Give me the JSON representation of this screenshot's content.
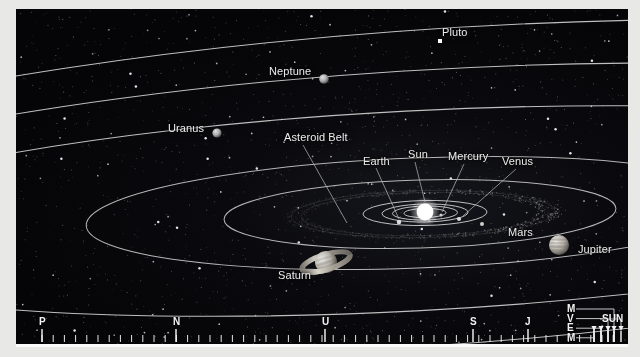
{
  "diagram": {
    "background_color": "#050507",
    "orbit_color": "#c9c9c9",
    "label_color": "#ececec",
    "frame_color": "#e8e8e6"
  },
  "bodies": [
    {
      "name": "Sun",
      "label": "Sun",
      "x": 409,
      "y": 203,
      "r": 8.5,
      "color": "#ffffff",
      "kind": "star"
    },
    {
      "name": "Mercury",
      "label": "Mercury",
      "x": 424,
      "y": 206,
      "r": 1.6,
      "color": "#cfcfcf",
      "kind": "planet"
    },
    {
      "name": "Venus",
      "label": "Venus",
      "x": 443,
      "y": 210,
      "r": 2.0,
      "color": "#d8d8d8",
      "kind": "planet"
    },
    {
      "name": "Earth",
      "label": "Earth",
      "x": 383,
      "y": 213,
      "r": 2.1,
      "color": "#d6d6d6",
      "kind": "planet"
    },
    {
      "name": "Mars",
      "label": "Mars",
      "x": 466,
      "y": 215,
      "r": 1.8,
      "color": "#cdcdcd",
      "kind": "planet"
    },
    {
      "name": "Jupiter",
      "label": "Jupiter",
      "x": 543,
      "y": 236,
      "r": 10.0,
      "color": "#b9b4ad",
      "kind": "planet"
    },
    {
      "name": "Saturn",
      "label": "Saturn",
      "x": 310,
      "y": 253,
      "r": 11.0,
      "color": "#bdb8ae",
      "kind": "ringed"
    },
    {
      "name": "Uranus",
      "label": "Uranus",
      "x": 201,
      "y": 124,
      "r": 4.6,
      "color": "#b3b3b3",
      "kind": "planet"
    },
    {
      "name": "Neptune",
      "label": "Neptune",
      "x": 308,
      "y": 70,
      "r": 4.6,
      "color": "#b0b0b0",
      "kind": "planet"
    },
    {
      "name": "Pluto",
      "label": "Pluto",
      "x": 424,
      "y": 32,
      "r": 2.0,
      "color": "#ffffff",
      "kind": "dwarf"
    }
  ],
  "features": [
    {
      "name": "Asteroid Belt",
      "label": "Asteroid Belt"
    }
  ],
  "labels": [
    {
      "key": "pluto",
      "text": "Pluto",
      "x": 426,
      "y": 18,
      "anchor": "left"
    },
    {
      "key": "neptune",
      "text": "Neptune",
      "x": 253,
      "y": 57,
      "anchor": "left"
    },
    {
      "key": "uranus",
      "text": "Uranus",
      "x": 152,
      "y": 114,
      "anchor": "left"
    },
    {
      "key": "asteroid_belt",
      "text": "Asteroid Belt",
      "x": 268,
      "y": 126,
      "anchor": "left"
    },
    {
      "key": "earth",
      "text": "Earth",
      "x": 347,
      "y": 150,
      "anchor": "left"
    },
    {
      "key": "sun",
      "text": "Sun",
      "x": 392,
      "y": 143,
      "anchor": "left"
    },
    {
      "key": "mercury",
      "text": "Mercury",
      "x": 433,
      "y": 145,
      "anchor": "left"
    },
    {
      "key": "venus",
      "text": "Venus",
      "x": 486,
      "y": 150,
      "anchor": "left"
    },
    {
      "key": "mars",
      "text": "Mars",
      "x": 492,
      "y": 221,
      "anchor": "left"
    },
    {
      "key": "jupiter",
      "text": "Jupiter",
      "x": 562,
      "y": 238,
      "anchor": "left"
    },
    {
      "key": "saturn",
      "text": "Saturn",
      "x": 262,
      "y": 264,
      "anchor": "left"
    }
  ],
  "scale": {
    "name": "distance-scale",
    "major_ticks": [
      {
        "label": "P",
        "x": 26,
        "tall": true
      },
      {
        "label": "N",
        "x": 160,
        "tall": true
      },
      {
        "label": "U",
        "x": 309,
        "tall": true
      },
      {
        "label": "S",
        "x": 457,
        "tall": true
      },
      {
        "label": "J",
        "x": 512,
        "tall": true
      },
      {
        "label": "M",
        "x": 578,
        "tall": true
      },
      {
        "label": "V",
        "x": 585,
        "tall": true
      },
      {
        "label": "E",
        "x": 592,
        "tall": true
      },
      {
        "label": "M",
        "x": 598,
        "tall": true
      },
      {
        "label": "SUN",
        "x": 611,
        "tall": true
      }
    ],
    "inner_stack_labels": [
      "M",
      "V",
      "E",
      "M"
    ],
    "sun_label": "SUN",
    "minor_tick_spacing": 11.2,
    "minor_tick_count": 52
  }
}
